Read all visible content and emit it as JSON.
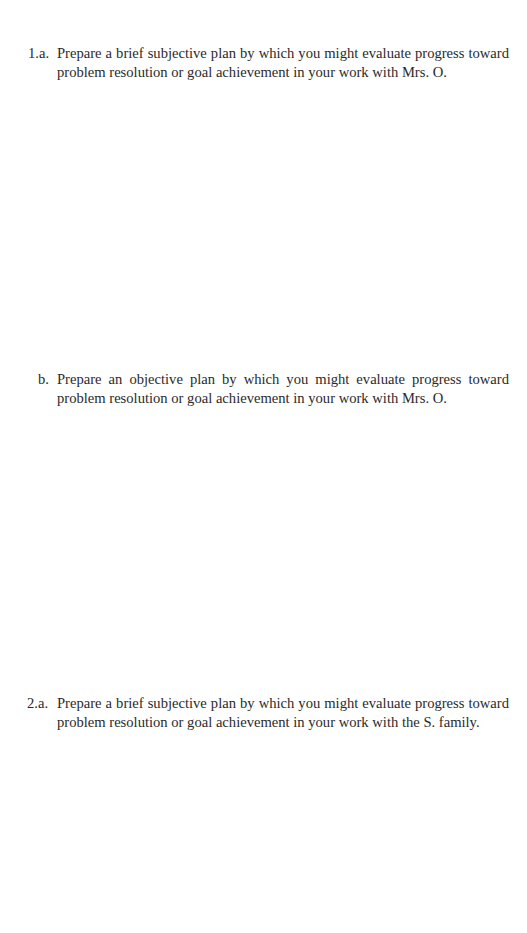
{
  "questions": [
    {
      "label": "1.a.",
      "line1": "Prepare a brief subjective plan by which you might evaluate progress toward",
      "line2": "problem resolution or goal achievement in your work with Mrs. O."
    },
    {
      "label": "b.",
      "line1": "Prepare an objective plan by which you might evaluate progress toward",
      "line2": "problem resolution or goal achievement in your work with Mrs. O."
    },
    {
      "label": "2.a.",
      "line1": "Prepare a brief subjective plan by which you might evaluate progress toward",
      "line2": "problem resolution or goal achievement in your work with the S. family."
    }
  ],
  "colors": {
    "text": "#2a2a2a",
    "background": "#ffffff"
  }
}
